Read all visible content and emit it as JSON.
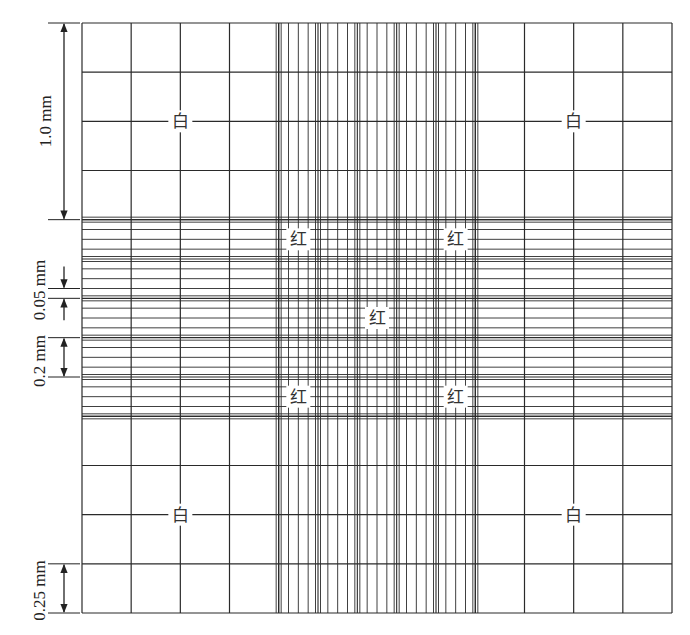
{
  "diagram": {
    "grid": {
      "total_size_mm": 3.0,
      "large_square_mm": 1.0,
      "white_cell_square_mm": 0.25,
      "red_cell_group_mm": 0.2,
      "red_cell_small_square_mm": 0.05,
      "large_squares_per_side": 3,
      "subdivisions_per_outer_large_square": 4,
      "central_groups_per_side": 5,
      "central_subdivisions_per_group": 4,
      "line_color": "#2a2a2a"
    },
    "labels": {
      "white": "白",
      "red": "红"
    },
    "white_label_positions": [
      {
        "name": "white-label-top-left",
        "col_mm": 0.5,
        "row_mm": 0.5
      },
      {
        "name": "white-label-top-right",
        "col_mm": 2.5,
        "row_mm": 0.5
      },
      {
        "name": "white-label-bottom-left",
        "col_mm": 0.5,
        "row_mm": 2.5
      },
      {
        "name": "white-label-bottom-right",
        "col_mm": 2.5,
        "row_mm": 2.5
      }
    ],
    "red_label_positions": [
      {
        "name": "red-label-top-left",
        "col_mm": 1.1,
        "row_mm": 1.1
      },
      {
        "name": "red-label-top-right",
        "col_mm": 1.9,
        "row_mm": 1.1
      },
      {
        "name": "red-label-center",
        "col_mm": 1.5,
        "row_mm": 1.5
      },
      {
        "name": "red-label-bottom-left",
        "col_mm": 1.1,
        "row_mm": 1.9
      },
      {
        "name": "red-label-bottom-right",
        "col_mm": 1.9,
        "row_mm": 1.9
      }
    ],
    "dimensions": [
      {
        "name": "dimension-1mm",
        "text": "1.0 mm",
        "from_mm": 0.0,
        "to_mm": 1.0,
        "style": "outer-arrows"
      },
      {
        "name": "dimension-0.05mm",
        "text": "0.05 mm",
        "from_mm": 1.35,
        "to_mm": 1.4,
        "style": "inward-arrows"
      },
      {
        "name": "dimension-0.2mm",
        "text": "0.2 mm",
        "from_mm": 1.6,
        "to_mm": 1.8,
        "style": "outer-arrows"
      },
      {
        "name": "dimension-0.25mm",
        "text": "0.25 mm",
        "from_mm": 2.75,
        "to_mm": 3.0,
        "style": "outer-arrows"
      }
    ]
  }
}
